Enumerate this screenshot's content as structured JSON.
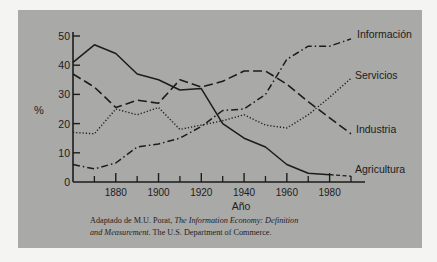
{
  "chart_data": {
    "type": "line",
    "title": "",
    "xlabel": "Año",
    "ylabel": "%",
    "xlim": [
      1860,
      1990
    ],
    "ylim": [
      0,
      50
    ],
    "x_ticks": [
      1880,
      1900,
      1920,
      1940,
      1960,
      1980
    ],
    "x_minor_ticks": [
      1870,
      1890,
      1910,
      1930,
      1950,
      1970,
      1990
    ],
    "y_ticks": [
      0,
      10,
      20,
      30,
      40,
      50
    ],
    "grid": false,
    "legend_position": "inline-right",
    "x": [
      1860,
      1870,
      1880,
      1890,
      1900,
      1910,
      1920,
      1930,
      1940,
      1950,
      1960,
      1970,
      1980,
      1990
    ],
    "series": [
      {
        "name": "Agricultura",
        "style": "solid",
        "values": [
          41,
          47,
          44,
          37,
          35,
          31.5,
          32,
          20,
          15,
          12,
          6,
          3,
          2.5,
          2
        ],
        "projected_from": 1980
      },
      {
        "name": "Industria",
        "style": "dashed",
        "values": [
          37,
          32.5,
          25.5,
          28,
          27,
          35,
          32.5,
          34.5,
          38,
          38,
          33.5,
          27.5,
          22,
          16.5
        ]
      },
      {
        "name": "Servicios",
        "style": "dotted",
        "values": [
          17,
          16.5,
          25,
          23,
          25.5,
          18,
          19.5,
          21,
          23,
          19.5,
          18.5,
          23,
          29,
          35.5
        ]
      },
      {
        "name": "Información",
        "style": "dash-dot",
        "values": [
          6,
          4.5,
          6.5,
          12,
          13,
          15,
          19,
          24.5,
          25,
          30,
          42,
          46.5,
          46.5,
          49
        ]
      }
    ]
  },
  "labels": {
    "y_axis": "%",
    "x_axis": "Año",
    "series_labels": [
      "Información",
      "Servicios",
      "Industria",
      "Agricultura"
    ]
  },
  "caption": {
    "prefix": "Adaptado de M.U. Porat, ",
    "title_italic_1": "The Information Economy: Definition",
    "title_italic_2": "and Measurement",
    "suffix": ". The U.S. Department of Commerce."
  }
}
